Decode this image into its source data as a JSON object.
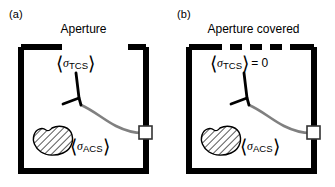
{
  "figure": {
    "width": 335,
    "height": 187,
    "background": "#ffffff",
    "ink_color": "#000000",
    "trajectory_color": "#808080",
    "caption_font_size_px": 12
  },
  "panels": [
    {
      "id": "a",
      "label": "(a)",
      "title": "Aperture",
      "aperture_state": "open",
      "aperture_style": "gap",
      "labels": {
        "tcs": {
          "open_bracket": "⟨",
          "symbol": "σ",
          "subscript": "TCS",
          "close_bracket": "⟩",
          "suffix": ""
        },
        "acs": {
          "open_bracket": "⟨",
          "symbol": "σ",
          "subscript": "ACS",
          "close_bracket": "⟩",
          "suffix": ""
        }
      }
    },
    {
      "id": "b",
      "label": "(b)",
      "title": "Aperture covered",
      "aperture_state": "covered",
      "aperture_style": "dashed",
      "labels": {
        "tcs": {
          "open_bracket": "⟨",
          "symbol": "σ",
          "subscript": "TCS",
          "close_bracket": "⟩",
          "suffix": "= 0"
        },
        "acs": {
          "open_bracket": "⟨",
          "symbol": "σ",
          "subscript": "ACS",
          "close_bracket": "⟩",
          "suffix": ""
        }
      }
    }
  ],
  "elements": {
    "enclosure_name": "reverberation-chamber-box",
    "blob_name": "hatched-absorber-blob",
    "branch_name": "antenna-branch",
    "trajectory_name": "ray-trajectory",
    "detector_name": "detector-square"
  }
}
